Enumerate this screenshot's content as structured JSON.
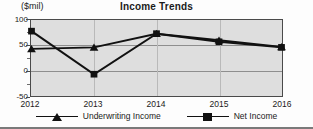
{
  "chart_data": {
    "type": "line",
    "title": "Income Trends",
    "unit_caption": "($mil)",
    "xlabel": "",
    "ylabel": "($mil)",
    "categories": [
      "2012",
      "2013",
      "2014",
      "2015",
      "2016"
    ],
    "ylim": [
      -50,
      100
    ],
    "yticks": [
      100,
      50,
      0,
      -50
    ],
    "ytick_labels": [
      "100",
      "50",
      "0",
      "-50"
    ],
    "grid": true,
    "legend_position": "bottom",
    "series": [
      {
        "name": "Underwriting Income",
        "marker": "triangle",
        "color": "#111111",
        "values": [
          43,
          46,
          73,
          60,
          47
        ]
      },
      {
        "name": "Net Income",
        "marker": "square",
        "color": "#111111",
        "values": [
          78,
          -7,
          73,
          57,
          46
        ]
      }
    ]
  },
  "axis": {
    "ytick_labels": [
      "100",
      "50",
      "0",
      "-50"
    ],
    "xtick_labels": [
      "2012",
      "2013",
      "2014",
      "2015",
      "2016"
    ]
  },
  "legend": {
    "items": [
      {
        "label": "Underwriting Income",
        "marker": "triangle-marker-icon"
      },
      {
        "label": "Net Income",
        "marker": "square-marker-icon"
      }
    ]
  }
}
